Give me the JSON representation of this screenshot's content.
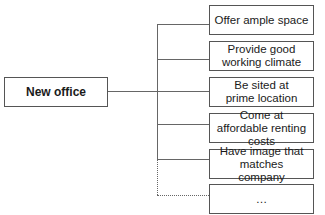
{
  "diagram": {
    "root": {
      "label": "New office"
    },
    "children": [
      {
        "label": "Offer ample space"
      },
      {
        "label": "Provide good working climate"
      },
      {
        "label": "Be sited at prime location"
      },
      {
        "label": "Come at affordable renting costs"
      },
      {
        "label": "Have image that matches company"
      },
      {
        "label": "…"
      }
    ]
  }
}
